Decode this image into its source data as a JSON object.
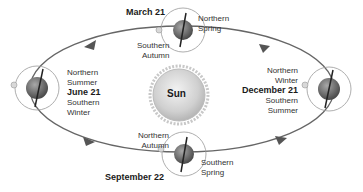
{
  "sun": {
    "label": "Sun"
  },
  "positions": {
    "march": {
      "date": "March 21",
      "northern": [
        "Northern",
        "Spring"
      ],
      "southern": [
        "Southern",
        "Autumn"
      ]
    },
    "june": {
      "date": "June 21",
      "northern": [
        "Northern",
        "Summer"
      ],
      "southern": [
        "Southern",
        "Winter"
      ]
    },
    "september": {
      "date": "September 22",
      "northern": [
        "Northern",
        "Autumn"
      ],
      "southern": [
        "Southern",
        "Spring"
      ]
    },
    "december": {
      "date": "December 21",
      "northern": [
        "Northern",
        "Winter"
      ],
      "southern": [
        "Southern",
        "Summer"
      ]
    }
  },
  "colors": {
    "orbit": "#666666",
    "earth": "#7a7a7a",
    "sun": "#d4d4d4",
    "text": "#333333"
  }
}
